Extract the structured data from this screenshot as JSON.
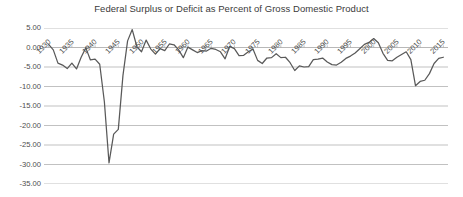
{
  "chart_data": {
    "type": "line",
    "title": "Federal Surplus or Deficit as Percent of Gross Domestic Product",
    "xlabel": "",
    "ylabel": "",
    "ylim": [
      -35,
      5
    ],
    "xlim": [
      1929,
      2016
    ],
    "grid": true,
    "legend": "none",
    "y_ticks": [
      "5.00",
      "0.00",
      "-5.00",
      "-10.00",
      "-15.00",
      "-20.00",
      "-25.00",
      "-30.00",
      "-35.00"
    ],
    "y_tick_values": [
      5,
      0,
      -5,
      -10,
      -15,
      -20,
      -25,
      -30,
      -35
    ],
    "x_ticks": [
      "1930",
      "1935",
      "1940",
      "1945",
      "1950",
      "1955",
      "1960",
      "1965",
      "1970",
      "1975",
      "1980",
      "1985",
      "1990",
      "1995",
      "2000",
      "2005",
      "2010",
      "2015"
    ],
    "x_tick_values": [
      1930,
      1935,
      1940,
      1945,
      1950,
      1955,
      1960,
      1965,
      1970,
      1975,
      1980,
      1985,
      1990,
      1995,
      2000,
      2005,
      2010,
      2015
    ],
    "line_color": "#595959",
    "grid_color": "#a6a6a6",
    "series": [
      {
        "name": "Federal Surplus or Deficit (% of GDP)",
        "x": [
          1930,
          1931,
          1932,
          1933,
          1934,
          1935,
          1936,
          1937,
          1938,
          1939,
          1940,
          1941,
          1942,
          1943,
          1944,
          1945,
          1946,
          1947,
          1948,
          1949,
          1950,
          1951,
          1952,
          1953,
          1954,
          1955,
          1956,
          1957,
          1958,
          1959,
          1960,
          1961,
          1962,
          1963,
          1964,
          1965,
          1966,
          1967,
          1968,
          1969,
          1970,
          1971,
          1972,
          1973,
          1974,
          1975,
          1976,
          1977,
          1978,
          1979,
          1980,
          1981,
          1982,
          1983,
          1984,
          1985,
          1986,
          1987,
          1988,
          1989,
          1990,
          1991,
          1992,
          1993,
          1994,
          1995,
          1996,
          1997,
          1998,
          1999,
          2000,
          2001,
          2002,
          2003,
          2004,
          2005,
          2006,
          2007,
          2008,
          2009,
          2010,
          2011,
          2012,
          2013,
          2014,
          2015
        ],
        "values": [
          0.8,
          -0.6,
          -4.0,
          -4.5,
          -5.4,
          -4.0,
          -5.5,
          -2.5,
          -0.1,
          -3.2,
          -3.0,
          -4.3,
          -13.9,
          -29.6,
          -22.2,
          -21.0,
          -7.2,
          1.7,
          4.6,
          0.2,
          -1.1,
          1.9,
          -0.4,
          -1.7,
          -0.3,
          -0.8,
          0.9,
          0.7,
          -0.6,
          -2.6,
          0.1,
          -0.6,
          -1.3,
          -0.8,
          -0.9,
          -0.2,
          -0.5,
          -1.1,
          -2.9,
          0.3,
          -0.3,
          -2.1,
          -2.0,
          -1.1,
          -0.4,
          -3.3,
          -4.1,
          -2.7,
          -2.6,
          -1.6,
          -2.6,
          -2.5,
          -3.9,
          -5.9,
          -4.7,
          -5.0,
          -4.9,
          -3.1,
          -3.0,
          -2.7,
          -3.7,
          -4.4,
          -4.5,
          -3.8,
          -2.8,
          -2.2,
          -1.4,
          -0.3,
          0.8,
          1.3,
          2.3,
          1.2,
          -1.5,
          -3.3,
          -3.4,
          -2.5,
          -1.8,
          -1.1,
          -3.1,
          -9.8,
          -8.7,
          -8.4,
          -6.7,
          -4.1,
          -2.8,
          -2.5
        ]
      }
    ]
  }
}
